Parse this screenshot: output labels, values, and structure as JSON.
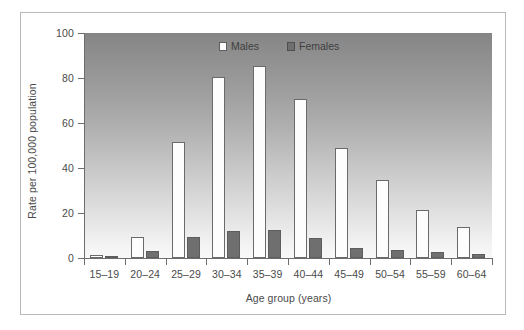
{
  "figure": {
    "background_color": "#ffffff",
    "frame_color": "#b9b9b9"
  },
  "chart_data": {
    "type": "bar",
    "title": "",
    "subtitle": "",
    "xlabel": "Age group (years)",
    "ylabel": "Rate per 100,000 population",
    "categories": [
      "15–19",
      "20–24",
      "25–29",
      "30–34",
      "35–39",
      "40–44",
      "45–49",
      "50–54",
      "55–59",
      "60–64"
    ],
    "series": [
      {
        "name": "Males",
        "color": "#fdfdfd",
        "edge_color": "#6a6a6a",
        "values": [
          1.5,
          9.5,
          51.5,
          80.5,
          85.5,
          70.5,
          49,
          34.5,
          21.5,
          14
        ]
      },
      {
        "name": "Females",
        "color": "#6f6f6f",
        "edge_color": "#5d5d5d",
        "values": [
          1,
          3,
          9.5,
          12,
          12.5,
          9,
          4.5,
          3.5,
          2.5,
          2
        ]
      }
    ],
    "ylim": [
      0,
      100
    ],
    "yticks": [
      0,
      20,
      40,
      60,
      80,
      100
    ],
    "ytick_labels": [
      "0",
      "20",
      "40",
      "60",
      "80",
      "100"
    ],
    "grid": false,
    "legend_position": "upper right inside plot",
    "plot_background": "vertical gradient dark gray to white"
  },
  "legend": {
    "items": [
      {
        "label": "Males",
        "swatch": "males-swatch"
      },
      {
        "label": "Females",
        "swatch": "females-swatch"
      }
    ]
  }
}
